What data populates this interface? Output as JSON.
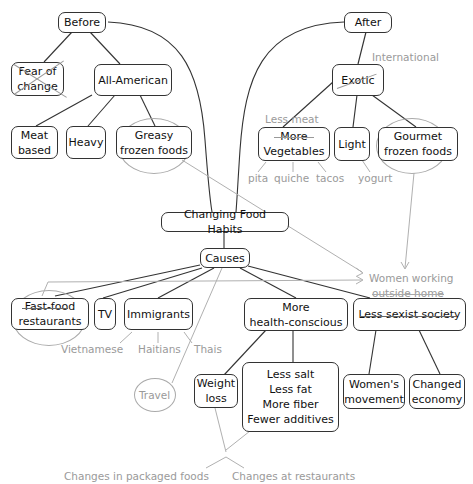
{
  "title": "Changing Food Habits",
  "nodes": {
    "before": "Before",
    "after": "After",
    "fear_of_change": "Fear of\nchange",
    "all_american": "All-American",
    "meat_based": "Meat\nbased",
    "heavy": "Heavy",
    "greasy_frozen": "Greasy\nfrozen foods",
    "exotic": "Exotic",
    "more_vegetables": "More\nVegetables",
    "light": "Light",
    "gourmet_frozen": "Gourmet\nfrozen foods",
    "center": "Changing Food Habits",
    "causes": "Causes",
    "fast_food": "Fast-food\nrestaurants",
    "tv": "TV",
    "immigrants": "Immigrants",
    "health_conscious": "More\nhealth-conscious",
    "less_sexist": "Less sexist society",
    "weight_loss": "Weight\nloss",
    "health_list": "Less salt\nLess fat\nMore fiber\nFewer additives",
    "womens_movement": "Women's\nmovement",
    "changed_economy": "Changed\neconomy"
  },
  "annotations": {
    "international": "International",
    "less_meat": "Less meat",
    "pita": "pita",
    "quiche": "quiche",
    "tacos": "tacos",
    "yogurt": "yogurt",
    "women_working_1": "Women working",
    "women_working_2": "outside home",
    "vietnamese": "Vietnamese",
    "haitians": "Haitians",
    "thais": "Thais",
    "travel": "Travel",
    "changes_packaged": "Changes in packaged foods",
    "changes_restaurants": "Changes at restaurants"
  },
  "colors": {
    "node_border": "#333333",
    "primary_line": "#333333",
    "annotation": "#9a9a9a"
  }
}
